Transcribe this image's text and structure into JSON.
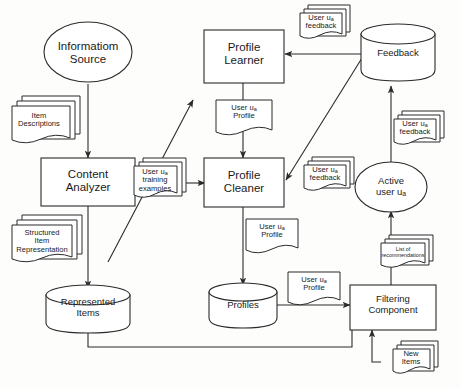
{
  "diagram": {
    "type": "flowchart",
    "background_color": "#fdfdfc",
    "stroke_color": "#2b2b2b",
    "fill_color": "#ffffff",
    "nodes": {
      "information_source": {
        "label": "Informatiom Source",
        "line1": "Informatiom",
        "line2": "Source",
        "shape": "ellipse"
      },
      "item_descriptions": {
        "label": "Item Descriptions",
        "line1": "Item",
        "line2": "Descriptions",
        "shape": "document-stack"
      },
      "content_analyzer": {
        "label": "Content Analyzer",
        "line1": "Content",
        "line2": "Analyzer",
        "shape": "rectangle"
      },
      "structured_item_representation": {
        "label": "Structured Item Representation",
        "line1": "Structured",
        "line2": "Item",
        "line3": "Representation",
        "shape": "document-stack"
      },
      "represented_items": {
        "label": "Represented Items",
        "line1": "Represented",
        "line2": "Items",
        "shape": "cylinder"
      },
      "training_examples": {
        "label": "User ua training examples",
        "line1_pre": "User u",
        "line1_sub": "a",
        "line2": "training",
        "line3": "examples",
        "shape": "document-stack"
      },
      "profile_learner": {
        "label": "Profile Learner",
        "line1": "Profile",
        "line2": "Learner",
        "shape": "rectangle"
      },
      "profile_top": {
        "label": "User ua Profile",
        "line1_pre": "User u",
        "line1_sub": "a",
        "line2": "Profile",
        "shape": "document"
      },
      "profile_cleaner": {
        "label": "Profile Cleaner",
        "line1": "Profile",
        "line2": "Cleaner",
        "shape": "rectangle"
      },
      "profile_mid": {
        "label": "User ua Profile",
        "line1_pre": "User u",
        "line1_sub": "a",
        "line2": "Profile",
        "shape": "document"
      },
      "profiles": {
        "label": "Profiles",
        "line1": "Profiles",
        "shape": "cylinder"
      },
      "profile_bottom": {
        "label": "User ua Profile",
        "line1_pre": "User u",
        "line1_sub": "a",
        "line2": "Profile",
        "shape": "document"
      },
      "feedback_store": {
        "label": "Feedback",
        "line1": "Feedback",
        "shape": "cylinder"
      },
      "feedback_top": {
        "label": "User ua feedback",
        "line1_pre": "User u",
        "line1_sub": "a",
        "line2": "feedback",
        "shape": "document-stack"
      },
      "feedback_right": {
        "label": "User ua feedback",
        "line1_pre": "User u",
        "line1_sub": "a",
        "line2": "feedback",
        "shape": "document-stack"
      },
      "feedback_mid": {
        "label": "User ua feedback",
        "line1_pre": "User u",
        "line1_sub": "a",
        "line2": "feedback",
        "shape": "document-stack"
      },
      "active_user": {
        "label": "Active user ua",
        "line1": "Active",
        "line2_pre": "user u",
        "line2_sub": "a",
        "shape": "ellipse"
      },
      "list_of_recommendations": {
        "label": "List of recommendations",
        "line1": "List of",
        "line2": "recommendations",
        "shape": "document-stack"
      },
      "filtering_component": {
        "label": "Filtering Component",
        "line1": "Filtering",
        "line2": "Component",
        "shape": "rectangle"
      },
      "new_items": {
        "label": "New Items",
        "line1": "New",
        "line2": "Items",
        "shape": "document-stack"
      }
    },
    "edges": [
      {
        "from": "information_source",
        "to": "content_analyzer",
        "style": "arrow-down"
      },
      {
        "from": "content_analyzer",
        "to": "represented_items",
        "style": "arrow-down"
      },
      {
        "from": "represented_items",
        "to": "filtering_component",
        "style": "orthogonal"
      },
      {
        "from": "training_examples",
        "to": "profile_cleaner",
        "style": "arrow-right"
      },
      {
        "from": "represented_items",
        "to": "profile_learner",
        "style": "diagonal-arrow"
      },
      {
        "from": "profile_learner",
        "to": "profile_cleaner",
        "style": "arrow-down"
      },
      {
        "from": "profile_cleaner",
        "to": "profiles",
        "style": "arrow-down"
      },
      {
        "from": "profiles",
        "to": "filtering_component",
        "style": "arrow-right"
      },
      {
        "from": "feedback_store",
        "to": "profile_learner",
        "style": "arrow-left"
      },
      {
        "from": "feedback_store",
        "to": "profile_cleaner",
        "style": "diagonal-arrow"
      },
      {
        "from": "active_user",
        "to": "feedback_store",
        "style": "arrow-up"
      },
      {
        "from": "filtering_component",
        "to": "active_user",
        "style": "arrow-up"
      },
      {
        "from": "new_items",
        "to": "filtering_component",
        "style": "orthogonal-arrow"
      }
    ]
  }
}
